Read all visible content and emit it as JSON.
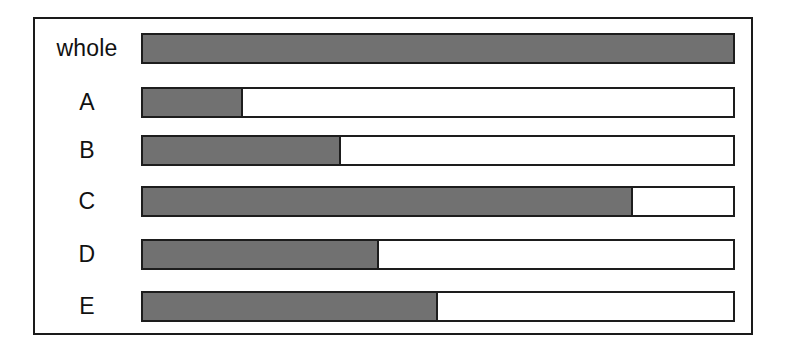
{
  "figure": {
    "name": "proportion-bar-diagram",
    "background_color": "#ffffff",
    "frame_border_color": "#1a1a1a",
    "bar_border_color": "#1d1d1d",
    "fill_color": "#717171",
    "empty_color": "#ffffff"
  },
  "chart_data": {
    "type": "bar",
    "orientation": "horizontal",
    "title": "",
    "subtitle": "",
    "xlabel": "",
    "ylabel": "",
    "xlim": [
      0,
      100
    ],
    "grid": false,
    "legend": null,
    "stacked": true,
    "categories": [
      "whole",
      "A",
      "B",
      "C",
      "D",
      "E"
    ],
    "series": [
      {
        "name": "filled",
        "color": "#717171",
        "values": [
          100,
          17,
          33.5,
          83,
          40,
          50
        ]
      },
      {
        "name": "remainder",
        "color": "#ffffff",
        "values": [
          0,
          83,
          66.5,
          17,
          60,
          50
        ]
      }
    ],
    "bars": [
      {
        "label": "whole",
        "filled_percent": 100,
        "empty_percent": 0
      },
      {
        "label": "A",
        "filled_percent": 17,
        "empty_percent": 83
      },
      {
        "label": "B",
        "filled_percent": 33.5,
        "empty_percent": 66.5
      },
      {
        "label": "C",
        "filled_percent": 83,
        "empty_percent": 17
      },
      {
        "label": "D",
        "filled_percent": 40,
        "empty_percent": 60
      },
      {
        "label": "E",
        "filled_percent": 50,
        "empty_percent": 50
      }
    ]
  }
}
